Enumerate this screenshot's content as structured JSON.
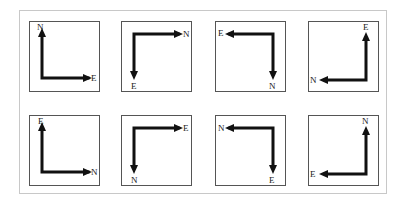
{
  "figure": {
    "rows": 2,
    "columns": 4,
    "panels": [
      {
        "id": "p1",
        "row": 0,
        "col": 0,
        "corner": "bottom-left",
        "up_label": "N",
        "side_label": "E",
        "vertical_label": "N",
        "horizontal_label": "E"
      },
      {
        "id": "p2",
        "row": 0,
        "col": 1,
        "corner": "top-left",
        "vertical_label": "E",
        "horizontal_label": "N"
      },
      {
        "id": "p3",
        "row": 0,
        "col": 2,
        "corner": "top-right",
        "vertical_label": "N",
        "horizontal_label": "E"
      },
      {
        "id": "p4",
        "row": 0,
        "col": 3,
        "corner": "bottom-right",
        "vertical_label": "E",
        "horizontal_label": "N"
      },
      {
        "id": "p5",
        "row": 1,
        "col": 0,
        "corner": "bottom-left",
        "vertical_label": "E",
        "horizontal_label": "N"
      },
      {
        "id": "p6",
        "row": 1,
        "col": 1,
        "corner": "top-left",
        "vertical_label": "N",
        "horizontal_label": "E"
      },
      {
        "id": "p7",
        "row": 1,
        "col": 2,
        "corner": "top-right",
        "vertical_label": "E",
        "horizontal_label": "N"
      },
      {
        "id": "p8",
        "row": 1,
        "col": 3,
        "corner": "bottom-right",
        "vertical_label": "N",
        "horizontal_label": "E"
      }
    ]
  },
  "colors": {
    "arrow": "#111111",
    "panel_border": "#555555",
    "frame_border": "#c8c8c8"
  }
}
